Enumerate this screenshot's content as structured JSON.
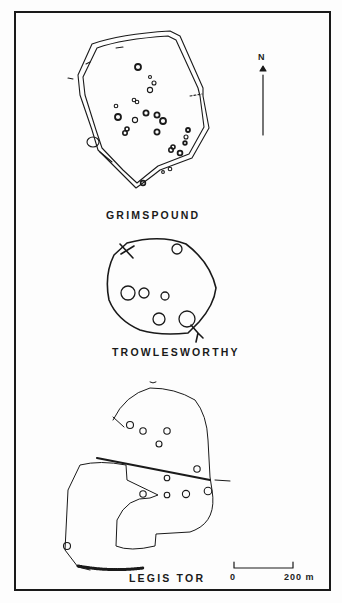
{
  "figure": {
    "sites": [
      {
        "name": "GRIMSPOUND"
      },
      {
        "name": "TROWLESWORTHY"
      },
      {
        "name": "LEGIS TOR"
      }
    ],
    "north_arrow": {
      "label": "N"
    },
    "scale_bar": {
      "start_label": "0",
      "end_label": "200 m"
    }
  },
  "colors": {
    "ink": "#1a1a1a",
    "paper": "#fdfdfd"
  }
}
